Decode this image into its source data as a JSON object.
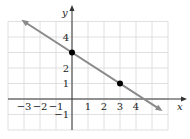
{
  "chart_data": {
    "type": "line",
    "title": "",
    "xlabel": "x",
    "ylabel": "y",
    "xlim": [
      -4,
      6
    ],
    "ylim": [
      -2,
      5
    ],
    "grid": true,
    "x_tick_labels": [
      "−3",
      "−2",
      "−1",
      "1",
      "2",
      "3",
      "4"
    ],
    "x_ticks": [
      -3,
      -2,
      -1,
      1,
      2,
      3,
      4
    ],
    "y_tick_labels": [
      "4",
      "2",
      "1",
      "−1"
    ],
    "y_ticks": [
      4,
      2,
      1,
      -1
    ],
    "series": [
      {
        "name": "line",
        "equation": "y = -2/3 x + 3",
        "slope": -0.6667,
        "intercept": 3,
        "color": "#8a8a8a",
        "arrows": "both",
        "x": [
          -3,
          5.5
        ],
        "y": [
          5,
          -0.6667
        ]
      }
    ],
    "points": [
      {
        "x": 0,
        "y": 3
      },
      {
        "x": 3,
        "y": 1
      }
    ]
  },
  "colors": {
    "grid": "#d8d8d8",
    "axis": "#333333",
    "line": "#8a8a8a",
    "point": "#000000"
  }
}
